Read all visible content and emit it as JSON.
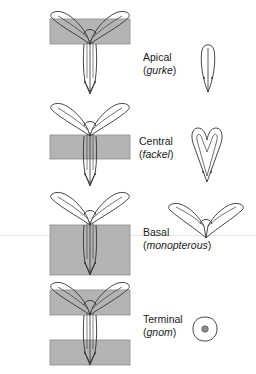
{
  "figure": {
    "colors": {
      "shaded_region": "#b4b4b4",
      "shaded_border": "#8c8c8c",
      "outline": "#333333",
      "dot": "#8a8a8a"
    },
    "rows": [
      {
        "name": "apical",
        "region": "Apical",
        "mutant": "gurke"
      },
      {
        "name": "central",
        "region": "Central",
        "mutant": "fackel"
      },
      {
        "name": "basal",
        "region": "Basal",
        "mutant": "monopterous"
      },
      {
        "name": "terminal",
        "region": "Terminal",
        "mutant": "gnom"
      }
    ]
  }
}
